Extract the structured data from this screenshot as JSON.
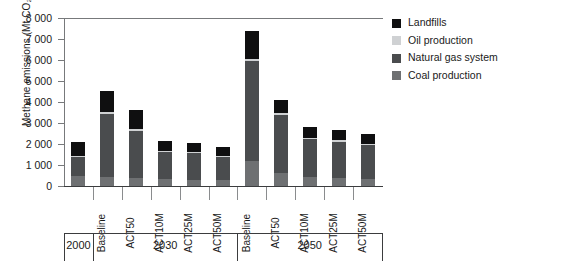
{
  "chart_data": {
    "type": "bar",
    "stacked": true,
    "title": "",
    "xlabel": "",
    "ylabel": "Methane emissions (Mt CO₂ eq)",
    "ylim": [
      0,
      8000
    ],
    "ytick_step": 1000,
    "ytick_labels": [
      "8 000",
      "7 000",
      "6 000",
      "5 000",
      "4 000",
      "3 000",
      "2 000",
      "1 000",
      "0"
    ],
    "ytick_values": [
      8000,
      7000,
      6000,
      5000,
      4000,
      3000,
      2000,
      1000,
      0
    ],
    "grid": false,
    "legend_position": "right",
    "groups": [
      {
        "label": "2000",
        "categories": [
          "2000"
        ]
      },
      {
        "label": "2030",
        "categories": [
          "Baseline",
          "ACT50",
          "ACT10M",
          "ACT25M",
          "ACT50M"
        ]
      },
      {
        "label": "2050",
        "categories": [
          "Baseline",
          "ACT50",
          "ACT10M",
          "ACT25M",
          "ACT50M"
        ]
      }
    ],
    "categories": [
      "2000",
      "Baseline",
      "ACT50",
      "ACT10M",
      "ACT25M",
      "ACT50M",
      "Baseline",
      "ACT50",
      "ACT10M",
      "ACT25M",
      "ACT50M"
    ],
    "series": [
      {
        "name": "Coal production",
        "color": "#6e7072",
        "values": [
          500,
          430,
          400,
          330,
          300,
          280,
          1200,
          620,
          430,
          380,
          340
        ]
      },
      {
        "name": "Natural gas system",
        "color": "#4a4c4e",
        "values": [
          870,
          3020,
          2240,
          1300,
          1250,
          1100,
          4760,
          2760,
          1800,
          1740,
          1600
        ]
      },
      {
        "name": "Oil production",
        "color": "#cfd1d3",
        "values": [
          60,
          70,
          70,
          60,
          60,
          50,
          100,
          90,
          70,
          70,
          60
        ]
      },
      {
        "name": "Landfills",
        "color": "#0f0f10",
        "values": [
          680,
          1000,
          900,
          470,
          450,
          420,
          1340,
          630,
          490,
          480,
          460
        ]
      }
    ],
    "totals": [
      2110,
      4520,
      3610,
      2160,
      2060,
      1850,
      7400,
      4100,
      2790,
      2670,
      2460
    ]
  },
  "legend": {
    "items": [
      {
        "label": "Landfills",
        "color": "#0f0f10"
      },
      {
        "label": "Oil production",
        "color": "#cfd1d3"
      },
      {
        "label": "Natural gas system",
        "color": "#4a4c4e"
      },
      {
        "label": "Coal production",
        "color": "#6e7072"
      }
    ]
  }
}
